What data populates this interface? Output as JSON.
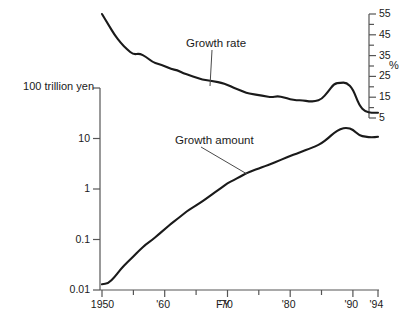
{
  "chart_data": {
    "type": "line",
    "title": "",
    "subtitle": "",
    "xlabel": "FY",
    "ylabel_left": "100 trillion yen",
    "ylabel_right": "%",
    "grid": false,
    "legend_position": "inline-annotation",
    "x_axis": {
      "range": [
        1950,
        1994
      ],
      "tick_labels": [
        "1950",
        "'60",
        "'70",
        "'80",
        "'90",
        "'94"
      ],
      "tick_values": [
        1950,
        1960,
        1970,
        1980,
        1990,
        1994
      ],
      "minor_tick_values": [
        1955,
        1965,
        1975,
        1985
      ]
    },
    "y_axis_left": {
      "scale": "log",
      "range": [
        0.01,
        100
      ],
      "tick_labels": [
        "100 trillion yen",
        "10",
        "1",
        "0.1",
        "0.01"
      ],
      "tick_values": [
        100,
        10,
        1,
        0.1,
        0.01
      ],
      "unit": "100 trillion yen"
    },
    "y_axis_right": {
      "scale": "linear",
      "range": [
        5,
        55
      ],
      "tick_labels": [
        "55",
        "45",
        "35",
        "25",
        "15",
        "5"
      ],
      "tick_values": [
        55,
        45,
        35,
        25,
        15,
        5
      ],
      "minor_tick_values": [
        50,
        40,
        30,
        20,
        10
      ],
      "unit": "%"
    },
    "series": [
      {
        "name": "Growth rate",
        "axis": "right",
        "unit": "%",
        "x": [
          1950,
          1951,
          1952,
          1953,
          1954,
          1955,
          1956,
          1957,
          1958,
          1959,
          1960,
          1961,
          1962,
          1963,
          1964,
          1965,
          1966,
          1967,
          1968,
          1969,
          1970,
          1971,
          1972,
          1973,
          1974,
          1975,
          1976,
          1977,
          1978,
          1979,
          1980,
          1981,
          1982,
          1983,
          1984,
          1985,
          1986,
          1987,
          1988,
          1989,
          1990,
          1991,
          1992,
          1993,
          1994
        ],
        "values": [
          55.0,
          50.0,
          45.0,
          41.0,
          38.0,
          35.5,
          36.0,
          34.5,
          32.0,
          31.0,
          30.0,
          28.5,
          28.0,
          26.5,
          25.5,
          24.5,
          23.5,
          23.0,
          22.5,
          22.0,
          21.0,
          19.5,
          18.5,
          17.0,
          16.5,
          16.0,
          15.5,
          15.0,
          15.5,
          15.0,
          14.0,
          13.5,
          13.5,
          13.0,
          13.0,
          14.0,
          17.5,
          21.5,
          22.0,
          22.0,
          19.0,
          11.0,
          8.0,
          7.5,
          7.5
        ]
      },
      {
        "name": "Growth amount",
        "axis": "left",
        "unit": "100 trillion yen",
        "x": [
          1950,
          1951,
          1952,
          1953,
          1954,
          1955,
          1956,
          1957,
          1958,
          1959,
          1960,
          1961,
          1962,
          1963,
          1964,
          1965,
          1966,
          1967,
          1968,
          1969,
          1970,
          1971,
          1972,
          1973,
          1974,
          1975,
          1976,
          1977,
          1978,
          1979,
          1980,
          1981,
          1982,
          1983,
          1984,
          1985,
          1986,
          1987,
          1988,
          1989,
          1990,
          1991,
          1992,
          1993,
          1994
        ],
        "values": [
          0.013,
          0.0135,
          0.018,
          0.026,
          0.035,
          0.046,
          0.062,
          0.08,
          0.098,
          0.125,
          0.16,
          0.205,
          0.255,
          0.32,
          0.4,
          0.47,
          0.57,
          0.7,
          0.86,
          1.05,
          1.3,
          1.5,
          1.75,
          2.05,
          2.3,
          2.55,
          2.85,
          3.15,
          3.55,
          4.0,
          4.5,
          5.0,
          5.6,
          6.2,
          7.0,
          8.0,
          10.0,
          13.0,
          15.5,
          16.5,
          15.0,
          11.5,
          10.8,
          10.5,
          10.8
        ]
      }
    ],
    "annotations": [
      {
        "name": "Growth rate",
        "text": "Growth rate",
        "label_x": 186,
        "label_y": 44,
        "leader_to_x": 210,
        "leader_to_y": 86
      },
      {
        "name": "Growth amount",
        "text": "Growth amount",
        "label_x": 175,
        "label_y": 141,
        "leader_to_x": 247,
        "leader_to_y": 174
      }
    ]
  },
  "axis_labels": {
    "left_unit": "100 trillion yen",
    "right_unit": "%",
    "x_title": "FY",
    "left_ticks": [
      "10",
      "1",
      "0.1",
      "0.01"
    ],
    "right_ticks": [
      "55",
      "45",
      "35",
      "25",
      "15",
      "5"
    ],
    "x_ticks": [
      "1950",
      "'60",
      "'70",
      "'80",
      "'90",
      "'94"
    ]
  },
  "series_labels": {
    "growth_rate": "Growth rate",
    "growth_amount": "Growth amount"
  },
  "colors": {
    "line": "#1a1a1a",
    "axis": "#555555",
    "text": "#1a1a1a",
    "background": "#ffffff"
  }
}
